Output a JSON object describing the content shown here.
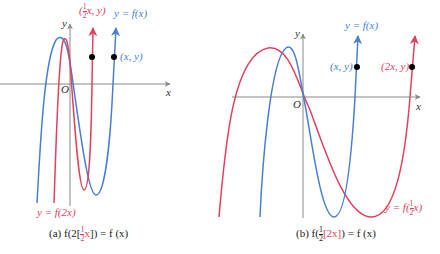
{
  "colors": {
    "original": "#4a7fd0",
    "transformed": "#e0415e",
    "axis": "#888888",
    "point": "#000000"
  },
  "panel_a": {
    "axis_x_label": "x",
    "axis_y_label": "y",
    "origin_label": "O",
    "blue_curve_label": "y = f(x)",
    "red_curve_label": "y = f(2x)",
    "blue_point_label": "(x, y)",
    "red_point_label_prefix": "(",
    "red_point_frac_num": "1",
    "red_point_frac_den": "2",
    "red_point_label_suffix": "x, y)",
    "caption_prefix": "(a) f",
    "caption_mid": "2",
    "caption_frac_num": "1",
    "caption_frac_den": "2",
    "caption_var": "x",
    "caption_suffix": " = f (x)"
  },
  "panel_b": {
    "axis_x_label": "x",
    "axis_y_label": "y",
    "origin_label": "O",
    "blue_curve_label": "y = f(x)",
    "red_curve_label_prefix": "y = f",
    "red_curve_frac_num": "1",
    "red_curve_frac_den": "2",
    "red_curve_var": "x",
    "blue_point_label": "(x, y)",
    "red_point_label": "(2x, y)",
    "caption_prefix": "(b) f",
    "caption_frac_num": "1",
    "caption_frac_den": "2",
    "caption_inner": "[2x]",
    "caption_suffix": " = f (x)"
  }
}
